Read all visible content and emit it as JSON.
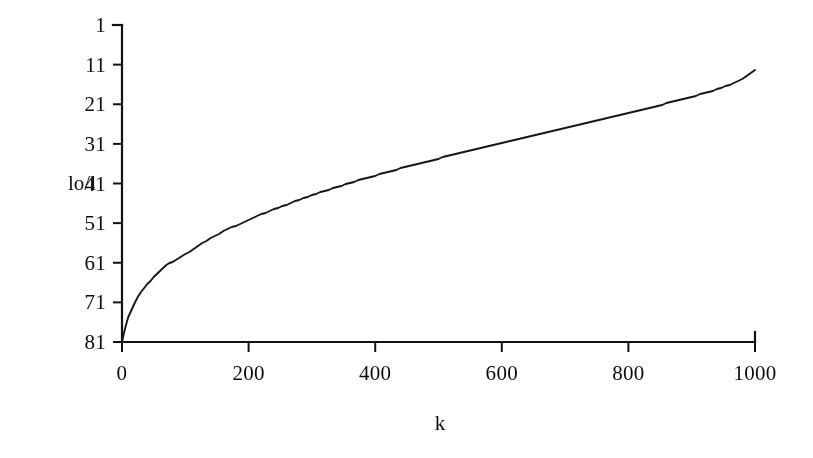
{
  "figure": {
    "background_color": "#ffffff",
    "ink_color": "#1a1a1a"
  },
  "axes": {
    "y_axis_title": "lo/l",
    "x_axis_title": "k",
    "y_tick_labels": [
      "81",
      "71",
      "61",
      "51",
      "41",
      "31",
      "21",
      "11",
      "1"
    ],
    "x_tick_labels": [
      "0",
      "200",
      "400",
      "600",
      "800",
      "1000"
    ]
  },
  "chart_data": {
    "type": "line",
    "title": "",
    "xlabel": "k",
    "ylabel": "lo/l",
    "xlim": [
      0,
      1000
    ],
    "ylim": [
      1,
      81
    ],
    "xticks": [
      0,
      200,
      400,
      600,
      800,
      1000
    ],
    "yticks": [
      1,
      11,
      21,
      31,
      41,
      51,
      61,
      71,
      81
    ],
    "grid": false,
    "legend": false,
    "series": [
      {
        "name": "lo/l vs k",
        "color": "#1a1a1a",
        "x": [
          0,
          2,
          5,
          8,
          10,
          15,
          20,
          25,
          30,
          40,
          50,
          60,
          70,
          80,
          90,
          100,
          120,
          140,
          160,
          180,
          200,
          220,
          240,
          260,
          280,
          300,
          320,
          340,
          360,
          380,
          400,
          420,
          440,
          460,
          480,
          500,
          520,
          540,
          560,
          580,
          600,
          620,
          640,
          660,
          680,
          700,
          720,
          740,
          760,
          780,
          800,
          820,
          840,
          860,
          880,
          900,
          920,
          940,
          960,
          980,
          1000
        ],
        "values": [
          1.0,
          2.6,
          4.6,
          6.2,
          7.2,
          9.2,
          10.9,
          12.3,
          13.6,
          15.6,
          17.4,
          19.0,
          20.4,
          21.3,
          22.2,
          23.1,
          25.3,
          27.2,
          28.9,
          30.4,
          31.8,
          33.2,
          34.5,
          35.7,
          36.9,
          38.0,
          39.1,
          40.1,
          41.1,
          42.1,
          43.0,
          43.9,
          44.8,
          45.6,
          46.5,
          47.3,
          48.1,
          48.9,
          49.6,
          50.4,
          51.3,
          52.1,
          52.8,
          53.6,
          54.3,
          55.1,
          55.8,
          56.5,
          57.2,
          58.0,
          58.8,
          59.6,
          60.4,
          61.2,
          62.0,
          62.9,
          63.8,
          64.8,
          65.9,
          67.4,
          69.6
        ]
      }
    ]
  }
}
